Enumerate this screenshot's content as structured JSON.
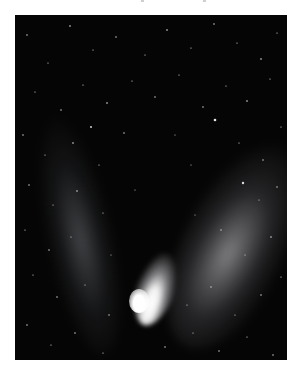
{
  "image": {
    "subject": "comet with two tails against a starfield",
    "description": "Black-and-white astrophotograph of a bright comet; a bright nucleus near the bottom center with a broad bright dust tail extending up-right and a fainter ion tail extending up-left, surrounded by scattered stars",
    "colors": {
      "page_background": "#ffffff",
      "sky": "#050505",
      "comet_core": "#ffffff",
      "star": "#e8e8e8"
    },
    "frame": {
      "x": 15,
      "y": 15,
      "width": 272,
      "height": 345
    },
    "nucleus_position": {
      "x": 138,
      "y": 308
    }
  }
}
